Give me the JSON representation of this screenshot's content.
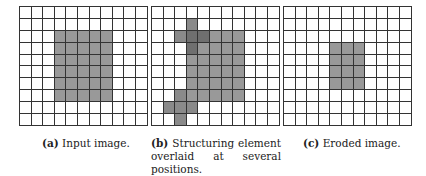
{
  "figure": {
    "grid_rows": 10,
    "grid_cols": 11,
    "colors": {
      "background": "#ffffff",
      "foreground": "#999999",
      "structuring_element": "#8a8a8a",
      "overlap": "#6f6f6f",
      "grid_line": "#333333"
    },
    "panels": [
      {
        "id": "a",
        "label": "(a)",
        "caption": "Input image.",
        "foreground_cells": {
          "rows": [
            2,
            7
          ],
          "cols": [
            3,
            7
          ]
        },
        "se_cells": []
      },
      {
        "id": "b",
        "label": "(b)",
        "caption": "Structuring element overlaid at several positions.",
        "foreground_cells": {
          "rows": [
            2,
            7
          ],
          "cols": [
            3,
            7
          ]
        },
        "se_cells": [
          [
            1,
            3
          ],
          [
            2,
            2
          ],
          [
            2,
            3
          ],
          [
            2,
            4
          ],
          [
            3,
            3
          ],
          [
            7,
            2
          ],
          [
            8,
            1
          ],
          [
            8,
            2
          ],
          [
            8,
            3
          ],
          [
            9,
            2
          ]
        ]
      },
      {
        "id": "c",
        "label": "(c)",
        "caption": "Eroded image.",
        "foreground_cells": {
          "rows": [
            3,
            6
          ],
          "cols": [
            4,
            6
          ]
        },
        "se_cells": []
      }
    ]
  }
}
